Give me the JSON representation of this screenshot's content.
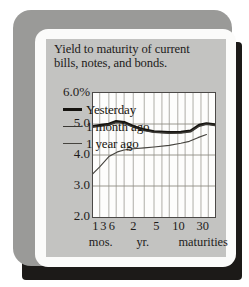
{
  "card": {
    "frame_color": "#9a9a98",
    "mat_color": "#fbfbfa",
    "panel_color": "#c3c3c1",
    "shadow_color": "#1c1a18"
  },
  "title": {
    "line1": "Yield to maturity of current",
    "line2": "bills, notes, and bonds."
  },
  "chart_data": {
    "type": "line",
    "title": "Yield to maturity of current bills, notes, and bonds.",
    "xlabel": "maturities",
    "ylabel": "",
    "grid": true,
    "legend_position": "inside-lower-left",
    "ylim": [
      2.0,
      6.0
    ],
    "ytick_values": [
      6.0,
      5.0,
      4.0,
      3.0,
      2.0
    ],
    "ytick_labels": [
      "6.0%",
      "5.0",
      "4.0",
      "3.0",
      "2.0"
    ],
    "x_positions": [
      0.0,
      0.055,
      0.13,
      0.255,
      0.38,
      0.5,
      0.625,
      0.75,
      0.875,
      1.0
    ],
    "xtick_labels": [
      "1",
      "3",
      "6",
      "2",
      "5",
      "10",
      "30"
    ],
    "xtick_positions": [
      0.02,
      0.085,
      0.155,
      0.33,
      0.52,
      0.7,
      0.9
    ],
    "xunit_labels": [
      "mos.",
      "yr.",
      "maturities"
    ],
    "xunit_positions": [
      0.02,
      0.36,
      0.66
    ],
    "series": [
      {
        "name": "Yesterday",
        "style": "thick",
        "color": "#15130f",
        "x": [
          0.0,
          0.055,
          0.13,
          0.19,
          0.255,
          0.33,
          0.42,
          0.5,
          0.625,
          0.72,
          0.8,
          0.87,
          0.93,
          1.0
        ],
        "values": [
          4.93,
          4.96,
          5.0,
          5.09,
          5.06,
          4.93,
          4.82,
          4.76,
          4.73,
          4.74,
          4.78,
          4.97,
          5.02,
          4.98
        ]
      },
      {
        "name": "1 month ago",
        "style": "medium",
        "color": "#3a3834",
        "x": [
          0.0,
          0.055,
          0.13,
          0.19,
          0.255,
          0.33,
          0.42,
          0.5,
          0.625,
          0.72,
          0.8,
          0.87,
          0.93,
          1.0
        ],
        "values": [
          4.9,
          4.93,
          4.97,
          5.05,
          5.02,
          4.9,
          4.79,
          4.73,
          4.7,
          4.71,
          4.75,
          4.93,
          4.99,
          4.95
        ]
      },
      {
        "name": "1 year ago",
        "style": "thin",
        "color": "#46443f",
        "x": [
          0.0,
          0.055,
          0.13,
          0.2,
          0.255,
          0.33,
          0.42,
          0.5,
          0.625,
          0.72,
          0.79,
          0.86,
          0.93
        ],
        "values": [
          3.4,
          3.62,
          3.95,
          4.1,
          4.16,
          4.2,
          4.23,
          4.26,
          4.31,
          4.38,
          4.44,
          4.56,
          4.66
        ]
      }
    ]
  },
  "legend": [
    {
      "label": "Yesterday",
      "swatch": "w-thick"
    },
    {
      "label": "1 month ago",
      "swatch": "w-med"
    },
    {
      "label": "1 year ago",
      "swatch": "w-thin"
    }
  ]
}
